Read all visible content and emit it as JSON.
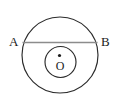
{
  "figure": {
    "background_color": "#ffffff",
    "stroke_color": "#2b2b2b",
    "chord_color": "#8c8c8c",
    "labels": {
      "left_point": "A",
      "right_point": "B",
      "center_point": "O"
    },
    "geometry": {
      "outer_circle": {
        "cx": 60,
        "cy": 55,
        "r": 38
      },
      "inner_circle": {
        "cx": 60.5,
        "cy": 62,
        "r": 15.5
      },
      "center_dot": {
        "cx": 59.5,
        "cy": 55.5,
        "r": 1.6
      },
      "chord": {
        "x1": 22.5,
        "y1": 42.5,
        "x2": 97.5,
        "y2": 42.5
      }
    },
    "label_positions": {
      "left_point": {
        "x": 9,
        "y": 46
      },
      "right_point": {
        "x": 101,
        "y": 46
      },
      "center_point": {
        "x": 56,
        "y": 70
      }
    }
  }
}
